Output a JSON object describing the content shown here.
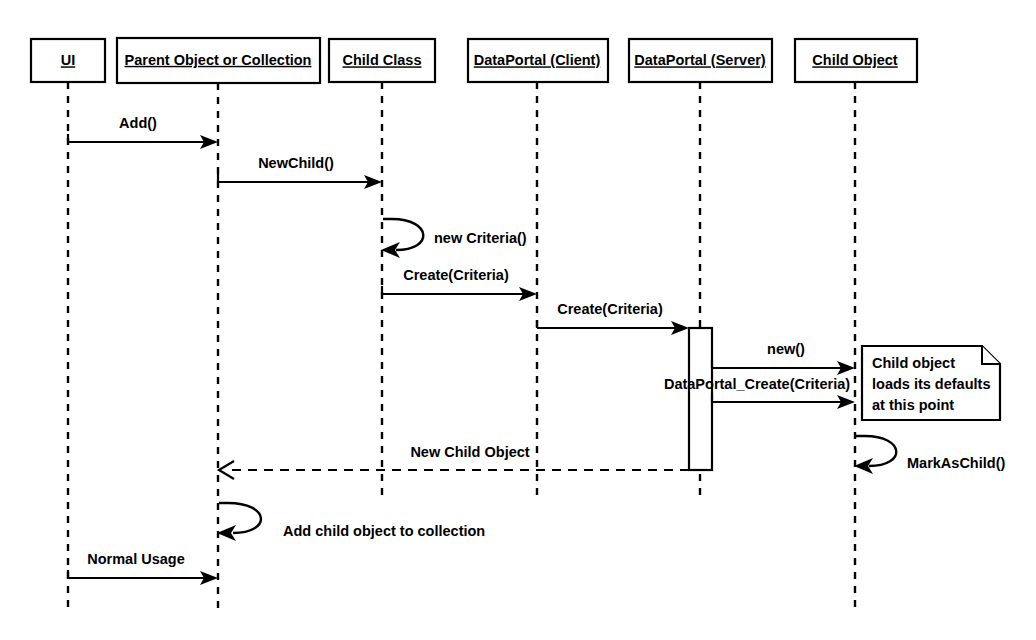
{
  "diagram": {
    "type": "uml-sequence-diagram",
    "title": "",
    "background_color": "#ffffff",
    "line_color": "#000000",
    "lifelines": [
      {
        "id": "ui",
        "label": "UI",
        "center_x": 68,
        "box_left": 31,
        "box_right": 105,
        "box_top": 39,
        "box_bottom": 82,
        "lifeline_bottom": 612
      },
      {
        "id": "parent",
        "label": "Parent Object or Collection",
        "center_x": 218,
        "box_left": 117,
        "box_right": 320,
        "box_top": 38,
        "box_bottom": 83,
        "lifeline_bottom": 612
      },
      {
        "id": "childcls",
        "label": "Child Class",
        "center_x": 382,
        "box_left": 329,
        "box_right": 435,
        "box_top": 39,
        "box_bottom": 82,
        "lifeline_bottom": 495
      },
      {
        "id": "dpclient",
        "label": "DataPortal (Client)",
        "center_x": 537,
        "box_left": 468,
        "box_right": 608,
        "box_top": 39,
        "box_bottom": 82,
        "lifeline_bottom": 495
      },
      {
        "id": "dpserver",
        "label": "DataPortal (Server)",
        "center_x": 700,
        "box_left": 629,
        "box_right": 772,
        "box_top": 39,
        "box_bottom": 82,
        "lifeline_bottom": 495
      },
      {
        "id": "childobj",
        "label": "Child Object",
        "center_x": 855,
        "box_left": 795,
        "box_right": 917,
        "box_top": 39,
        "box_bottom": 82,
        "lifeline_bottom": 612
      }
    ],
    "activations": [
      {
        "id": "dpserver-activation",
        "lifeline": "dpserver",
        "x": 689,
        "width": 23,
        "top": 328,
        "bottom": 470
      }
    ],
    "messages": [
      {
        "id": "m1",
        "label": "Add()",
        "from": "ui",
        "to": "parent",
        "y": 142,
        "kind": "call",
        "style": "solid",
        "label_align": "mid"
      },
      {
        "id": "m2",
        "label": "NewChild()",
        "from": "parent",
        "to": "childcls",
        "y": 182,
        "kind": "call",
        "style": "solid",
        "label_align": "mid"
      },
      {
        "id": "m3",
        "label": "new Criteria()",
        "from": "childcls",
        "to": "childcls",
        "y": 250,
        "kind": "self",
        "style": "solid",
        "label_align": "start"
      },
      {
        "id": "m4",
        "label": "Create(Criteria)",
        "from": "childcls",
        "to": "dpclient",
        "y": 294,
        "kind": "call",
        "style": "solid",
        "label_align": "mid"
      },
      {
        "id": "m5",
        "label": "Create(Criteria)",
        "from": "dpclient",
        "to": "dpserver",
        "y": 328,
        "kind": "call",
        "style": "solid",
        "label_align": "mid"
      },
      {
        "id": "m6",
        "label": "new()",
        "from": "dpserver",
        "to": "childobj",
        "y": 368,
        "kind": "call",
        "style": "solid",
        "label_align": "mid"
      },
      {
        "id": "m7",
        "label": "DataPortal_Create(Criteria)",
        "from": "dpserver",
        "to": "childobj",
        "y": 402,
        "kind": "call",
        "style": "solid",
        "label_align": "mid"
      },
      {
        "id": "m8",
        "label": "New Child Object",
        "from": "dpserver",
        "to": "parent",
        "y": 470,
        "kind": "return",
        "style": "dashed",
        "label_align": "mid"
      },
      {
        "id": "m9",
        "label": "MarkAsChild()",
        "from": "childobj",
        "to": "childobj",
        "y": 466,
        "kind": "self",
        "style": "solid",
        "label_align": "start"
      },
      {
        "id": "m10",
        "label": "Add child object to collection",
        "from": "parent",
        "to": "parent",
        "y": 533,
        "kind": "self",
        "style": "solid",
        "label_align": "start"
      },
      {
        "id": "m11",
        "label": "Normal Usage",
        "from": "ui",
        "to": "parent",
        "y": 578,
        "kind": "call",
        "style": "solid",
        "label_align": "mid"
      }
    ],
    "notes": [
      {
        "id": "note-child-defaults",
        "lines": [
          "Child object",
          "loads its defaults",
          "at this point"
        ],
        "left": 862,
        "top": 346,
        "right": 1000,
        "bottom": 420,
        "fold": 18
      }
    ]
  }
}
